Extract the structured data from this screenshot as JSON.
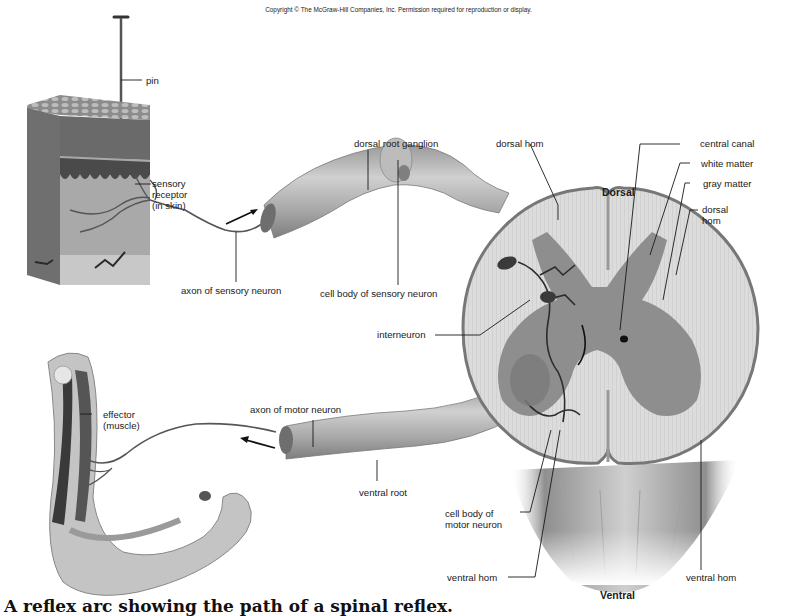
{
  "copyright": "Copyright © The McGraw-Hill Companies, Inc. Permission required for reproduction or display.",
  "orientation": {
    "top": "Dorsal",
    "bottom": "Ventral"
  },
  "labels": {
    "pin": "pin",
    "sensory_receptor": [
      "sensory",
      "receptor",
      "(in skin)"
    ],
    "axon_sensory": "axon of sensory neuron",
    "dorsal_root_ganglion": "dorsal root ganglion",
    "cell_body_sensory": "cell body of sensory neuron",
    "dorsal_horn_left": "dorsal hom",
    "central_canal": "central canal",
    "white_matter": "white matter",
    "gray_matter": "gray matter",
    "dorsal_horn_right": [
      "dorsal",
      "hom"
    ],
    "interneuron": "interneuron",
    "effector": [
      "effector",
      "(muscle)"
    ],
    "axon_motor": "axon of motor neuron",
    "ventral_root": "ventral root",
    "cell_body_motor": [
      "cell body of",
      "motor neuron"
    ],
    "ventral_horn_left": "ventral hom",
    "ventral_horn_right": "ventral hom"
  },
  "caption": "A reflex arc showing the path of a spinal reflex.",
  "colors": {
    "ink": "#1a1a1a",
    "white_matter": "#d9d9d9",
    "gray_matter": "#8a8a8a",
    "nerve": "#b5b5b5"
  }
}
